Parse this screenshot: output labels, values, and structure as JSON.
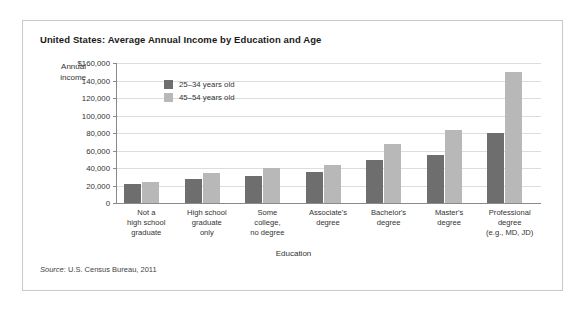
{
  "figure": {
    "title": "United States: Average Annual Income by Education and Age",
    "source": {
      "label": "Source",
      "text": ": U.S. Census Bureau, 2011"
    }
  },
  "chart_data": {
    "type": "bar",
    "title": "United States: Average Annual Income by Education and Age",
    "xlabel": "Education",
    "ylabel": "Annual income",
    "ylim": [
      0,
      160000
    ],
    "ytick_labels": [
      "$160,000",
      "140,000",
      "120,000",
      "100,000",
      "80,000",
      "60,000",
      "40,000",
      "20,000",
      "0"
    ],
    "ytick_values": [
      160000,
      140000,
      120000,
      100000,
      80000,
      60000,
      40000,
      20000,
      0
    ],
    "grid": true,
    "legend_position": "top-left-inside",
    "categories": [
      "Not a\nhigh school\ngraduate",
      "High school\ngraduate\nonly",
      "Some\ncollege,\nno degree",
      "Associate's\ndegree",
      "Bachelor's\ndegree",
      "Master's\ndegree",
      "Professional\ndegree\n(e.g., MD, JD)"
    ],
    "series": [
      {
        "name": "25–34 years old",
        "color": "#6e6e6e",
        "values": [
          21500,
          28000,
          31000,
          35000,
          49000,
          55000,
          80000
        ]
      },
      {
        "name": "45–54 years old",
        "color": "#b8b8b8",
        "values": [
          24000,
          34000,
          40000,
          43000,
          68000,
          83000,
          150000
        ]
      }
    ]
  }
}
